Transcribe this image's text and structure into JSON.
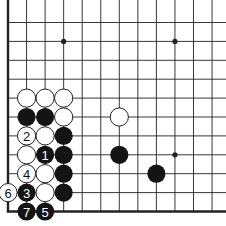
{
  "diagram": {
    "type": "go-board-fragment",
    "grid": {
      "origin_x": 8,
      "origin_y": 22.5,
      "spacing_x": 18.55,
      "spacing_y": 18.9,
      "cols": 12,
      "rows": 11,
      "edges": [
        "left",
        "bottom"
      ]
    },
    "star_points": [
      {
        "col": 3,
        "row": 1
      },
      {
        "col": 9,
        "row": 1
      },
      {
        "col": 9,
        "row": 7
      }
    ],
    "stones": [
      {
        "color": "white",
        "col": 1,
        "row": 4,
        "label": ""
      },
      {
        "color": "white",
        "col": 2,
        "row": 4,
        "label": ""
      },
      {
        "color": "white",
        "col": 3,
        "row": 4,
        "label": ""
      },
      {
        "color": "black",
        "col": 1,
        "row": 5,
        "label": ""
      },
      {
        "color": "black",
        "col": 2,
        "row": 5,
        "label": ""
      },
      {
        "color": "white",
        "col": 3,
        "row": 5,
        "label": ""
      },
      {
        "color": "white",
        "col": 6,
        "row": 5,
        "label": ""
      },
      {
        "color": "white",
        "col": 1,
        "row": 6,
        "label": "2"
      },
      {
        "color": "white",
        "col": 2,
        "row": 6,
        "label": ""
      },
      {
        "color": "black",
        "col": 3,
        "row": 6,
        "label": ""
      },
      {
        "color": "white",
        "col": 1,
        "row": 7,
        "label": ""
      },
      {
        "color": "black",
        "col": 2,
        "row": 7,
        "label": "1"
      },
      {
        "color": "black",
        "col": 3,
        "row": 7,
        "label": ""
      },
      {
        "color": "black",
        "col": 6,
        "row": 7,
        "label": ""
      },
      {
        "color": "white",
        "col": 1,
        "row": 8,
        "label": "4"
      },
      {
        "color": "white",
        "col": 2,
        "row": 8,
        "label": ""
      },
      {
        "color": "black",
        "col": 3,
        "row": 8,
        "label": ""
      },
      {
        "color": "black",
        "col": 8,
        "row": 8,
        "label": ""
      },
      {
        "color": "white",
        "col": 0,
        "row": 9,
        "label": "6"
      },
      {
        "color": "black",
        "col": 1,
        "row": 9,
        "label": "3"
      },
      {
        "color": "white",
        "col": 2,
        "row": 9,
        "label": ""
      },
      {
        "color": "black",
        "col": 3,
        "row": 9,
        "label": ""
      },
      {
        "color": "black",
        "col": 1,
        "row": 10,
        "label": "7"
      },
      {
        "color": "black",
        "col": 2,
        "row": 10,
        "label": "5"
      }
    ],
    "colors": {
      "line": "#222222",
      "black_stone": "#141414",
      "white_stone": "#ffffff",
      "background": "#ffffff"
    }
  }
}
